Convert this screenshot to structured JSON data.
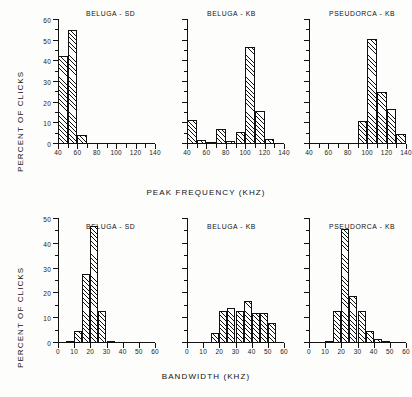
{
  "figure": {
    "y_axis_label": "PERCENT OF CLICKS",
    "top_x_axis_label": "PEAK FREQUENCY  (KHZ)",
    "bottom_x_axis_label": "BANDWIDTH  (KHZ)"
  },
  "chart_data": [
    {
      "type": "bar",
      "title": "BELUGA  -  SD",
      "xlabel": "PEAK FREQUENCY  (KHZ)",
      "ylabel": "PERCENT OF CLICKS",
      "xlim": [
        40,
        140
      ],
      "ylim": [
        0,
        60
      ],
      "xticks": [
        40,
        50,
        60,
        70,
        80,
        90,
        100,
        110,
        120,
        130,
        140
      ],
      "xticklabels": [
        "40",
        "",
        "60",
        "",
        "80",
        "",
        "100",
        "",
        "120",
        "",
        "140"
      ],
      "yticks": [
        0,
        10,
        20,
        30,
        40,
        50,
        60
      ],
      "yticklabels": [
        "0",
        "10",
        "20",
        "30",
        "40",
        "50",
        "60"
      ],
      "bin_width": 10,
      "bins": [
        {
          "start": 40,
          "end": 50,
          "value": 42.5
        },
        {
          "start": 50,
          "end": 60,
          "value": 55
        },
        {
          "start": 60,
          "end": 70,
          "value": 4.5
        }
      ],
      "grid": false,
      "legend": "none"
    },
    {
      "type": "bar",
      "title": "BELUGA  -  KB",
      "xlabel": "PEAK FREQUENCY  (KHZ)",
      "ylabel": "PERCENT OF CLICKS",
      "xlim": [
        40,
        140
      ],
      "ylim": [
        0,
        60
      ],
      "xticks": [
        40,
        50,
        60,
        70,
        80,
        90,
        100,
        110,
        120,
        130,
        140
      ],
      "xticklabels": [
        "40",
        "",
        "60",
        "",
        "80",
        "",
        "100",
        "",
        "120",
        "",
        "140"
      ],
      "yticks": [
        0,
        10,
        20,
        30,
        40,
        50,
        60
      ],
      "yticklabels": [
        "",
        "",
        "",
        "",
        "",
        "",
        ""
      ],
      "bin_width": 10,
      "bins": [
        {
          "start": 40,
          "end": 50,
          "value": 11.5
        },
        {
          "start": 50,
          "end": 60,
          "value": 2
        },
        {
          "start": 60,
          "end": 70,
          "value": 0.4
        },
        {
          "start": 70,
          "end": 80,
          "value": 7.5
        },
        {
          "start": 80,
          "end": 90,
          "value": 1.6
        },
        {
          "start": 90,
          "end": 100,
          "value": 6
        },
        {
          "start": 100,
          "end": 110,
          "value": 47
        },
        {
          "start": 110,
          "end": 120,
          "value": 16
        },
        {
          "start": 120,
          "end": 130,
          "value": 2.2
        }
      ],
      "grid": false,
      "legend": "none"
    },
    {
      "type": "bar",
      "title": "PSEUDORCA  -  KB",
      "xlabel": "PEAK FREQUENCY  (KHZ)",
      "ylabel": "PERCENT OF CLICKS",
      "xlim": [
        40,
        140
      ],
      "ylim": [
        0,
        60
      ],
      "xticks": [
        40,
        50,
        60,
        70,
        80,
        90,
        100,
        110,
        120,
        130,
        140
      ],
      "xticklabels": [
        "40",
        "",
        "60",
        "",
        "80",
        "",
        "100",
        "",
        "120",
        "",
        "140"
      ],
      "yticks": [
        0,
        10,
        20,
        30,
        40,
        50,
        60
      ],
      "yticklabels": [
        "",
        "",
        "",
        "",
        "",
        "",
        ""
      ],
      "bin_width": 10,
      "bins": [
        {
          "start": 90,
          "end": 100,
          "value": 11
        },
        {
          "start": 100,
          "end": 110,
          "value": 51
        },
        {
          "start": 110,
          "end": 120,
          "value": 25
        },
        {
          "start": 120,
          "end": 130,
          "value": 17
        },
        {
          "start": 130,
          "end": 140,
          "value": 5
        }
      ],
      "grid": false,
      "legend": "none"
    },
    {
      "type": "bar",
      "title": "BELUGA  -  SD",
      "xlabel": "BANDWIDTH  (KHZ)",
      "ylabel": "PERCENT OF CLICKS",
      "xlim": [
        0,
        60
      ],
      "ylim": [
        0,
        50
      ],
      "xticks": [
        0,
        10,
        20,
        30,
        40,
        50,
        60
      ],
      "xticklabels": [
        "0",
        "10",
        "20",
        "30",
        "40",
        "50",
        "60"
      ],
      "yticks": [
        0,
        10,
        20,
        30,
        40,
        50
      ],
      "yticklabels": [
        "0",
        "10",
        "20",
        "30",
        "40",
        "50"
      ],
      "bin_width": 5,
      "bins": [
        {
          "start": 5,
          "end": 10,
          "value": 0.4
        },
        {
          "start": 10,
          "end": 15,
          "value": 5
        },
        {
          "start": 15,
          "end": 20,
          "value": 28
        },
        {
          "start": 20,
          "end": 25,
          "value": 47
        },
        {
          "start": 25,
          "end": 30,
          "value": 13
        },
        {
          "start": 30,
          "end": 35,
          "value": 0.5
        }
      ],
      "grid": false,
      "legend": "none"
    },
    {
      "type": "bar",
      "title": "BELUGA  -  KB",
      "xlabel": "BANDWIDTH  (KHZ)",
      "ylabel": "PERCENT OF CLICKS",
      "xlim": [
        0,
        60
      ],
      "ylim": [
        0,
        50
      ],
      "xticks": [
        0,
        10,
        20,
        30,
        40,
        50,
        60
      ],
      "xticklabels": [
        "0",
        "10",
        "20",
        "30",
        "40",
        "50",
        "60"
      ],
      "yticks": [
        0,
        10,
        20,
        30,
        40,
        50
      ],
      "yticklabels": [
        "",
        "",
        "",
        "",
        "",
        ""
      ],
      "bin_width": 5,
      "bins": [
        {
          "start": 15,
          "end": 20,
          "value": 4
        },
        {
          "start": 20,
          "end": 25,
          "value": 13
        },
        {
          "start": 25,
          "end": 30,
          "value": 14
        },
        {
          "start": 30,
          "end": 35,
          "value": 13
        },
        {
          "start": 35,
          "end": 40,
          "value": 17
        },
        {
          "start": 40,
          "end": 45,
          "value": 12
        },
        {
          "start": 45,
          "end": 50,
          "value": 12
        },
        {
          "start": 50,
          "end": 55,
          "value": 8
        }
      ],
      "grid": false,
      "legend": "none"
    },
    {
      "type": "bar",
      "title": "PSEUDORCA  -  KB",
      "xlabel": "BANDWIDTH  (KHZ)",
      "ylabel": "PERCENT OF CLICKS",
      "xlim": [
        0,
        60
      ],
      "ylim": [
        0,
        50
      ],
      "xticks": [
        0,
        10,
        20,
        30,
        40,
        50,
        60
      ],
      "xticklabels": [
        "0",
        "10",
        "20",
        "30",
        "40",
        "50",
        "60"
      ],
      "yticks": [
        0,
        10,
        20,
        30,
        40,
        50
      ],
      "yticklabels": [
        "",
        "",
        "",
        "",
        "",
        ""
      ],
      "bin_width": 5,
      "bins": [
        {
          "start": 10,
          "end": 15,
          "value": 1
        },
        {
          "start": 15,
          "end": 20,
          "value": 13
        },
        {
          "start": 20,
          "end": 25,
          "value": 46
        },
        {
          "start": 25,
          "end": 30,
          "value": 19
        },
        {
          "start": 30,
          "end": 35,
          "value": 13
        },
        {
          "start": 35,
          "end": 40,
          "value": 5
        },
        {
          "start": 40,
          "end": 45,
          "value": 1.5
        },
        {
          "start": 45,
          "end": 50,
          "value": 1
        }
      ],
      "grid": false,
      "legend": "none"
    }
  ]
}
